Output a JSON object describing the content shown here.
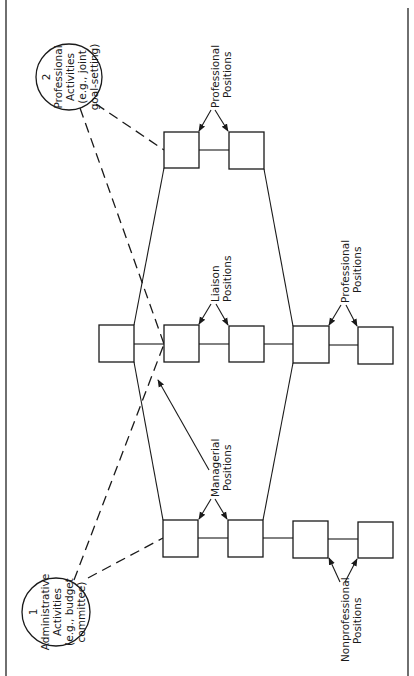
{
  "diagram": {
    "orientation": "rotated 90 degrees counter-clockwise",
    "activities": [
      {
        "number": "1",
        "lines": [
          "Administrative",
          "Activities",
          "(e.g., budget",
          "committee)"
        ]
      },
      {
        "number": "2",
        "lines": [
          "Professional",
          "Activities",
          "(e.g., joint",
          "goal-setting)"
        ]
      }
    ],
    "labels": {
      "professional_top": [
        "Professional",
        "Positions"
      ],
      "liaison": [
        "Liaison",
        "Positions"
      ],
      "professional_right": [
        "Professional",
        "Positions"
      ],
      "managerial": [
        "Managerial",
        "Positions"
      ],
      "nonprofessional": [
        "Nonprofessional",
        "Positions"
      ]
    },
    "node_groups": [
      {
        "name": "top-professional-pair",
        "boxes": 2
      },
      {
        "name": "middle-row",
        "boxes": 5
      },
      {
        "name": "bottom-row",
        "boxes": 4
      }
    ],
    "edge_styles": {
      "hierarchy": "solid",
      "activity_links": "dashed"
    }
  }
}
